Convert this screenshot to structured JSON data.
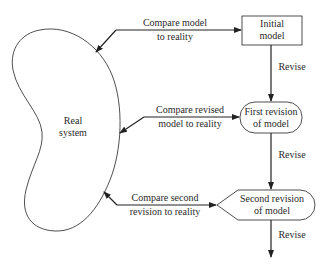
{
  "nodes": {
    "real_system": {
      "line1": "Real",
      "line2": "system"
    },
    "initial_model": {
      "line1": "Initial",
      "line2": "model"
    },
    "first_revision": {
      "line1": "First revision",
      "line2": "of model"
    },
    "second_revision": {
      "line1": "Second revision",
      "line2": "of model"
    }
  },
  "edges": {
    "compare_initial": {
      "line1": "Compare model",
      "line2": "to reality"
    },
    "compare_first": {
      "line1": "Compare revised",
      "line2": "model to reality"
    },
    "compare_second": {
      "line1": "Compare second",
      "line2": "revision to reality"
    },
    "revise_1": "Revise",
    "revise_2": "Revise",
    "revise_3": "Revise"
  },
  "colors": {
    "stroke": "#222222",
    "background": "#ffffff"
  }
}
